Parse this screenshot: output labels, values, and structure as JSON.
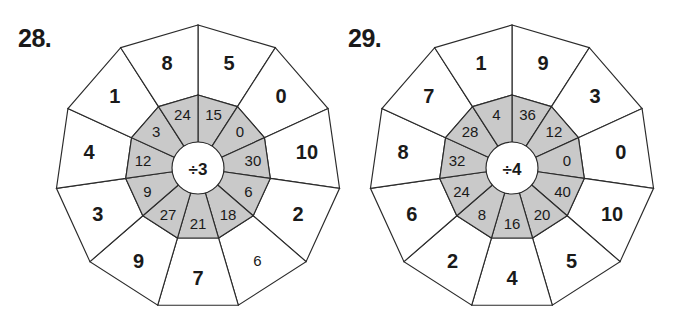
{
  "page": {
    "type": "math-worksheet-division-wheels",
    "background_color": "#ffffff",
    "ink_color": "#1a1a1a",
    "inner_ring_fill": "#c9c9c9",
    "outer_ring_fill": "#ffffff"
  },
  "problems": [
    {
      "id": "28",
      "label": "28.",
      "hub_label": "÷3",
      "divisor": 3,
      "segment_count": 11,
      "segments": [
        {
          "dividend": "15",
          "quotient": "5",
          "quotient_style": "bold"
        },
        {
          "dividend": "0",
          "quotient": "0",
          "quotient_style": "bold"
        },
        {
          "dividend": "30",
          "quotient": "10",
          "quotient_style": "bold"
        },
        {
          "dividend": "6",
          "quotient": "2",
          "quotient_style": "bold"
        },
        {
          "dividend": "18",
          "quotient": "6",
          "quotient_style": "light"
        },
        {
          "dividend": "21",
          "quotient": "7",
          "quotient_style": "bold"
        },
        {
          "dividend": "27",
          "quotient": "9",
          "quotient_style": "bold"
        },
        {
          "dividend": "9",
          "quotient": "3",
          "quotient_style": "bold"
        },
        {
          "dividend": "12",
          "quotient": "4",
          "quotient_style": "bold"
        },
        {
          "dividend": "3",
          "quotient": "1",
          "quotient_style": "bold"
        },
        {
          "dividend": "24",
          "quotient": "8",
          "quotient_style": "bold"
        }
      ]
    },
    {
      "id": "29",
      "label": "29.",
      "hub_label": "÷4",
      "divisor": 4,
      "segment_count": 11,
      "segments": [
        {
          "dividend": "36",
          "quotient": "9",
          "quotient_style": "bold"
        },
        {
          "dividend": "12",
          "quotient": "3",
          "quotient_style": "bold"
        },
        {
          "dividend": "0",
          "quotient": "0",
          "quotient_style": "bold"
        },
        {
          "dividend": "40",
          "quotient": "10",
          "quotient_style": "bold"
        },
        {
          "dividend": "20",
          "quotient": "5",
          "quotient_style": "bold"
        },
        {
          "dividend": "16",
          "quotient": "4",
          "quotient_style": "bold"
        },
        {
          "dividend": "8",
          "quotient": "2",
          "quotient_style": "bold"
        },
        {
          "dividend": "24",
          "quotient": "6",
          "quotient_style": "bold"
        },
        {
          "dividend": "32",
          "quotient": "8",
          "quotient_style": "bold"
        },
        {
          "dividend": "28",
          "quotient": "7",
          "quotient_style": "bold"
        },
        {
          "dividend": "4",
          "quotient": "1",
          "quotient_style": "bold"
        }
      ]
    }
  ]
}
